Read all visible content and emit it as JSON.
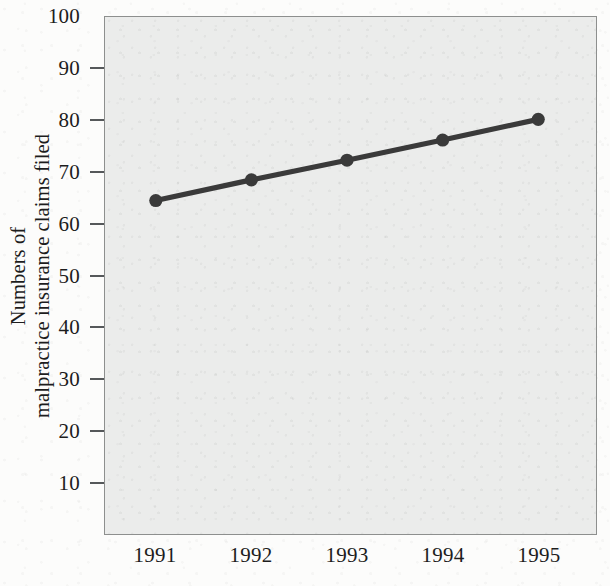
{
  "chart_data": {
    "type": "line",
    "title": "",
    "subtitle": "",
    "xlabel": "",
    "ylabel_lines": [
      "Numbers of",
      "malpractice insurance claims filed"
    ],
    "ylabel": "Numbers of malpractice insurance claims filed",
    "categories": [
      "1991",
      "1992",
      "1993",
      "1994",
      "1995"
    ],
    "x": [
      1991,
      1992,
      1993,
      1994,
      1995
    ],
    "values": [
      64.5,
      68.5,
      72.3,
      76.2,
      80.2
    ],
    "series": [
      {
        "name": "Malpractice insurance claims filed",
        "values": [
          64.5,
          68.5,
          72.3,
          76.2,
          80.2
        ]
      }
    ],
    "xtick_labels": [
      "1991",
      "1992",
      "1993",
      "1994",
      "1995"
    ],
    "ytick_labels": [
      "10",
      "20",
      "30",
      "40",
      "50",
      "60",
      "70",
      "80",
      "90",
      "100"
    ],
    "ytick_values": [
      10,
      20,
      30,
      40,
      50,
      60,
      70,
      80,
      90,
      100
    ],
    "ylim": [
      0,
      100
    ],
    "grid": false,
    "legend": false,
    "legend_position": "none",
    "marker": "filled-circle",
    "line_color": "#3a3a3a",
    "marker_color": "#3a3a3a",
    "plot_background": "#ebeceb",
    "page_background": "#fcfcfb",
    "axis_color": "#8d8f8e",
    "text_color": "#1d1d1d",
    "annotations": []
  }
}
